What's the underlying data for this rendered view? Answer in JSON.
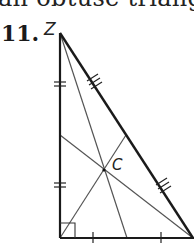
{
  "header": {
    "clipped_text": "an obtuse triangle",
    "problem_number": "11."
  },
  "diagram": {
    "vertex_label_top": "Z",
    "centroid_label": "C",
    "type": "right triangle with three medians meeting at centroid",
    "colors": {
      "stroke": "#1a1a1a",
      "median": "#555555"
    },
    "vertices": {
      "top": [
        60,
        33
      ],
      "bottom_left": [
        60,
        238
      ],
      "bottom_right": [
        193,
        238
      ]
    },
    "centroid": [
      104,
      170
    ],
    "markings": {
      "left_side": "double tick marks (equal segments)",
      "hypotenuse": "triple tick marks (equal segments)",
      "bottom_side": "single tick marks (equal segments)",
      "right_angle": "square at bottom-left vertex"
    }
  }
}
